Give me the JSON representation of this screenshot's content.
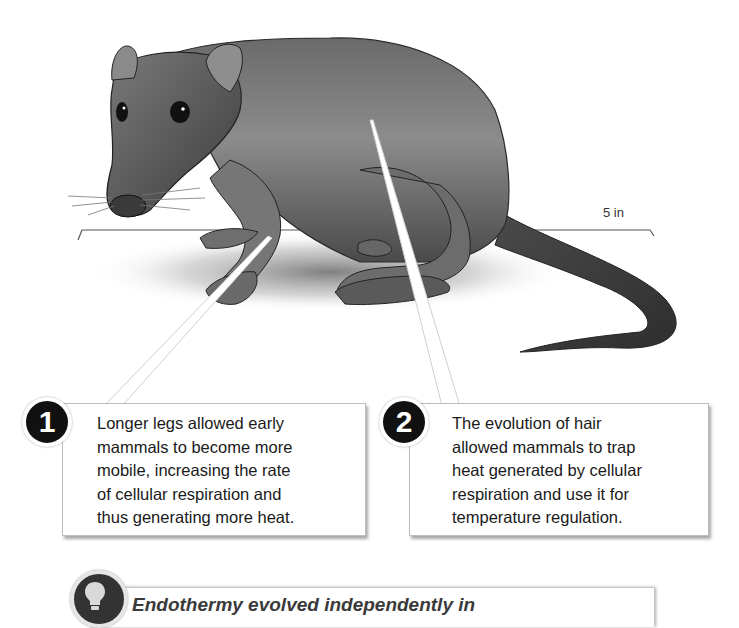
{
  "figure": {
    "scale_bar": {
      "label": "5 in"
    },
    "callouts": [
      {
        "number": "1",
        "text": "Longer legs allowed early mammals to become more mobile, increasing the rate of cellular respiration and thus generating more heat.",
        "lines": [
          "Longer legs allowed early",
          "mammals to become more",
          "mobile, increasing the rate",
          "of cellular respiration and",
          "thus generating more heat."
        ]
      },
      {
        "number": "2",
        "text": "The evolution of hair allowed mammals to trap heat generated by cellular respiration and use it for temperature regulation.",
        "lines": [
          "The evolution of hair",
          "allowed mammals to trap",
          "heat generated by cellular",
          "respiration and use it for",
          "temperature regulation."
        ]
      }
    ],
    "banner": {
      "icon": "lightbulb-icon",
      "text": "Endothermy evolved independently in"
    },
    "colors": {
      "badge_fill": "#111111",
      "animal_fur": "#5a5a5a",
      "callout_border": "#bdbdbd",
      "banner_text": "#3a3a3a"
    }
  }
}
